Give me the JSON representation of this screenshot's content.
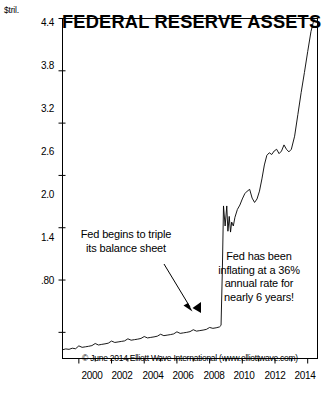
{
  "title": "FEDERAL RESERVE ASSETS",
  "unit_label": "$tril.",
  "copyright": "© June 2014 Elliott Wave International (www.elliottwave.com)",
  "annotations": {
    "left": {
      "line1": "Fed begins to triple",
      "line2": "its balance sheet"
    },
    "right": {
      "line1": "Fed has been",
      "line2": "inflating at a 36%",
      "line3": "annual rate for",
      "line4": "nearly 6 years!"
    }
  },
  "colors": {
    "line": "#000000",
    "frame": "#000000",
    "background": "#ffffff"
  },
  "chart_data": {
    "type": "line",
    "title": "FEDERAL RESERVE ASSETS",
    "xlabel": "",
    "ylabel": "$tril.",
    "xlim": [
      1999.0,
      2014.6
    ],
    "ylim": [
      0.5,
      4.4
    ],
    "grid": false,
    "legend": null,
    "yticks": [
      0.8,
      1.4,
      2.0,
      2.6,
      3.2,
      3.8,
      4.4
    ],
    "ytick_labels": [
      ".80",
      "1.4",
      "2.0",
      "2.6",
      "3.2",
      "3.8",
      "4.4"
    ],
    "xticks": [
      2000,
      2002,
      2004,
      2006,
      2008,
      2010,
      2012,
      2014
    ],
    "xtick_labels": [
      "2000",
      "2002",
      "2004",
      "2006",
      "2008",
      "2010",
      "2012",
      "2014"
    ],
    "xminor_ticks": [
      2001,
      2003,
      2005,
      2007,
      2009,
      2011,
      2013
    ],
    "series": [
      {
        "name": "Federal Reserve Assets",
        "x": [
          1999.0,
          1999.2,
          1999.4,
          1999.6,
          1999.8,
          2000.0,
          2000.2,
          2000.4,
          2000.6,
          2000.8,
          2001.0,
          2001.2,
          2001.4,
          2001.6,
          2001.8,
          2002.0,
          2002.2,
          2002.4,
          2002.6,
          2002.8,
          2003.0,
          2003.2,
          2003.4,
          2003.6,
          2003.8,
          2004.0,
          2004.2,
          2004.4,
          2004.6,
          2004.8,
          2005.0,
          2005.2,
          2005.4,
          2005.6,
          2005.8,
          2006.0,
          2006.2,
          2006.4,
          2006.6,
          2006.8,
          2007.0,
          2007.2,
          2007.4,
          2007.6,
          2007.8,
          2008.0,
          2008.2,
          2008.4,
          2008.6,
          2008.7,
          2008.78,
          2008.85,
          2008.95,
          2009.05,
          2009.12,
          2009.2,
          2009.28,
          2009.35,
          2009.45,
          2009.55,
          2009.7,
          2009.85,
          2010.0,
          2010.15,
          2010.3,
          2010.45,
          2010.6,
          2010.75,
          2010.9,
          2011.05,
          2011.2,
          2011.35,
          2011.5,
          2011.65,
          2011.8,
          2011.95,
          2012.1,
          2012.25,
          2012.4,
          2012.55,
          2012.7,
          2012.85,
          2013.0,
          2013.2,
          2013.4,
          2013.6,
          2013.8,
          2014.0,
          2014.2,
          2014.4
        ],
        "y": [
          0.6,
          0.61,
          0.605,
          0.618,
          0.612,
          0.645,
          0.628,
          0.634,
          0.64,
          0.648,
          0.672,
          0.655,
          0.662,
          0.668,
          0.676,
          0.7,
          0.684,
          0.69,
          0.696,
          0.702,
          0.726,
          0.71,
          0.716,
          0.722,
          0.73,
          0.752,
          0.736,
          0.742,
          0.748,
          0.756,
          0.778,
          0.762,
          0.768,
          0.774,
          0.782,
          0.806,
          0.788,
          0.794,
          0.8,
          0.808,
          0.83,
          0.814,
          0.82,
          0.826,
          0.834,
          0.856,
          0.846,
          0.852,
          0.862,
          0.88,
          1.52,
          2.25,
          2.02,
          2.25,
          1.96,
          2.13,
          1.95,
          2.065,
          2.02,
          2.12,
          2.21,
          2.26,
          2.33,
          2.39,
          2.42,
          2.44,
          2.34,
          2.29,
          2.33,
          2.42,
          2.56,
          2.72,
          2.83,
          2.86,
          2.84,
          2.88,
          2.9,
          2.85,
          2.88,
          2.95,
          2.9,
          2.87,
          2.9,
          3.05,
          3.3,
          3.55,
          3.78,
          4.02,
          4.25,
          4.4
        ]
      }
    ],
    "annotations": [
      {
        "text": "Fed begins to triple its balance sheet",
        "arrow_from_xy": [
          2005.6,
          1.35
        ],
        "arrow_to_xy": [
          2008.6,
          0.86
        ]
      },
      {
        "text": "Fed has been inflating at a 36% annual rate for nearly 6 years!",
        "arrow_from_xy": [
          2009.3,
          1.05
        ],
        "arrow_to_xy": [
          2008.85,
          0.98
        ]
      }
    ]
  }
}
